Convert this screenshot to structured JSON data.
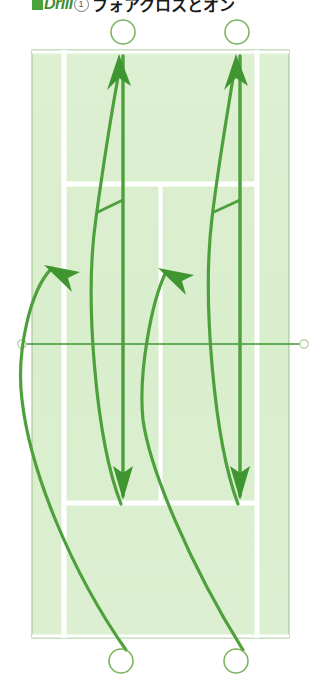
{
  "header": {
    "marker_icon": "green-square-icon",
    "drill_label": "Drill",
    "drill_number": "1",
    "title_jp": "フォアクロスとオン"
  },
  "diagram": {
    "name": "tennis-court-drill-diagram",
    "colors": {
      "court_fill": "#ddf0d2",
      "court_line": "#ffffff",
      "court_border": "#9cc18c",
      "stroke_green": "#4ea03c",
      "arrow_green": "#3f9630",
      "net_line": "#3f9630",
      "player_circle": "#7cb45f",
      "page_background": "#ffffff"
    },
    "court": {
      "left": 32,
      "right": 289,
      "top": 50,
      "bottom": 638,
      "singles_left": 64,
      "singles_right": 257,
      "net_y": 344,
      "service_line_top_y": 184,
      "service_line_bottom_y": 503,
      "center_service_line_x": 160.5,
      "net_post_left_x": 22,
      "net_post_right_x": 304
    },
    "players": [
      {
        "name": "player-top-left",
        "cx": 123,
        "cy": 32,
        "r": 12
      },
      {
        "name": "player-top-right",
        "cx": 237,
        "cy": 32,
        "r": 12
      },
      {
        "name": "player-bottom-left",
        "cx": 121,
        "cy": 661,
        "r": 12
      },
      {
        "name": "player-bottom-right",
        "cx": 236,
        "cy": 661,
        "r": 12
      }
    ],
    "shot_paths": [
      {
        "name": "ball-path-left-cross",
        "type": "ball",
        "description": "deep cross-court ball curving from bottom-left up to top-left",
        "d": "M 126 650 C 70 570, 30 470, 22 400 C 16 352, 30 290, 52 268"
      },
      {
        "name": "ball-path-right-cross",
        "type": "ball",
        "description": "deep cross-court ball curving from bottom-right up to mid court",
        "d": "M 243 650 C 190 565, 150 470, 143 420 C 138 372, 152 300, 166 272"
      },
      {
        "name": "player-move-left-forward",
        "type": "player-run",
        "description": "left player runs forward up to the net-side corner",
        "d": "M 121 504 C 96 440, 84 300, 96 218 C 104 160, 112 110, 119 72"
      },
      {
        "name": "player-move-right-forward",
        "type": "player-run",
        "description": "right player runs forward up to the net-side corner",
        "d": "M 238 504 C 214 440, 202 300, 212 218 C 219 160, 228 110, 234 72"
      },
      {
        "name": "ball-path-left-down",
        "type": "ball",
        "description": "straight ball driven down the left line",
        "d": "M 123 56 L 123 496"
      },
      {
        "name": "ball-path-right-down",
        "type": "ball",
        "description": "straight ball driven down the right line",
        "d": "M 240 56 L 240 496"
      },
      {
        "name": "connector-left",
        "type": "connector",
        "description": "short link from left run curve into the left down line",
        "d": "M 98 212 L 123 200"
      },
      {
        "name": "connector-right",
        "type": "connector",
        "description": "short link from right run curve into the right down line",
        "d": "M 214 212 L 240 200"
      }
    ],
    "arrows": [
      {
        "name": "arrow-up-left",
        "direction": "up",
        "x": 123,
        "y": 56
      },
      {
        "name": "arrow-up-right",
        "direction": "up",
        "x": 240,
        "y": 56
      },
      {
        "name": "arrow-down-left",
        "direction": "down",
        "x": 123,
        "y": 496
      },
      {
        "name": "arrow-down-right",
        "direction": "down",
        "x": 240,
        "y": 496
      },
      {
        "name": "arrow-diagonal-left",
        "direction": "up-left",
        "x": 52,
        "y": 268
      },
      {
        "name": "arrow-diagonal-right",
        "direction": "up-left",
        "x": 166,
        "y": 272
      }
    ]
  }
}
